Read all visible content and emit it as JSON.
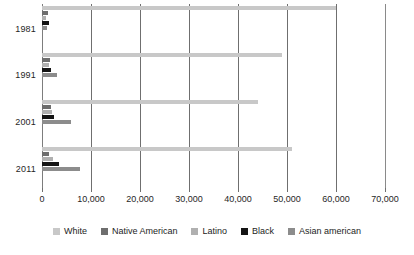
{
  "chart_data": {
    "type": "bar",
    "orientation": "horizontal",
    "title": "",
    "subtitle": "",
    "xlabel": "",
    "ylabel": "",
    "categories": [
      "1981",
      "1991",
      "2001",
      "2011"
    ],
    "xlim": [
      0,
      70000
    ],
    "xticks": [
      0,
      10000,
      20000,
      30000,
      40000,
      50000,
      60000,
      70000
    ],
    "xticklabels": [
      "0",
      "10,000",
      "20,000",
      "30,000",
      "40,000",
      "50,000",
      "60,000",
      "70,000"
    ],
    "grid": true,
    "grid_axis": "x",
    "legend_position": "bottom",
    "series": [
      {
        "name": "White",
        "color": "#c8c8c8",
        "values": [
          60000,
          49000,
          44000,
          51000
        ]
      },
      {
        "name": "Native American",
        "color": "#6e6e6e",
        "values": [
          1300,
          1700,
          1900,
          1500
        ]
      },
      {
        "name": "Latino",
        "color": "#b0b0b0",
        "values": [
          900,
          1500,
          2000,
          2200
        ]
      },
      {
        "name": "Black",
        "color": "#141414",
        "values": [
          1500,
          1800,
          2400,
          3500
        ]
      },
      {
        "name": "Asian american",
        "color": "#8c8c8c",
        "values": [
          1100,
          3000,
          6000,
          7800
        ]
      }
    ]
  },
  "legend": {
    "items": [
      {
        "label": "White",
        "color": "#c8c8c8"
      },
      {
        "label": "Native American",
        "color": "#6e6e6e"
      },
      {
        "label": "Latino",
        "color": "#b0b0b0"
      },
      {
        "label": "Black",
        "color": "#141414"
      },
      {
        "label": "Asian american",
        "color": "#8c8c8c"
      }
    ]
  },
  "axis": {
    "left_axis_color": "#7d7d7d",
    "gridline_color": "#6f6f6f"
  }
}
